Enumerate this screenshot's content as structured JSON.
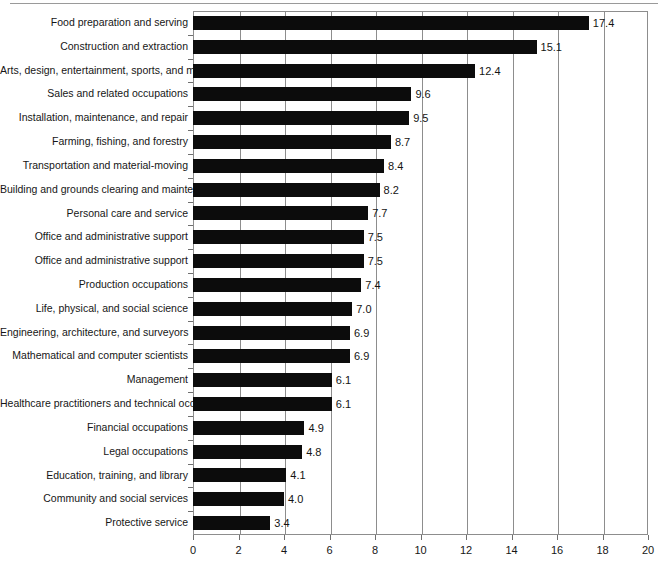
{
  "chart_data": {
    "type": "bar",
    "orientation": "horizontal",
    "title": "",
    "subtitle": "",
    "xlabel": "",
    "ylabel": "",
    "xlim": [
      0,
      20
    ],
    "xticks": [
      0,
      2,
      4,
      6,
      8,
      10,
      12,
      14,
      16,
      18,
      20
    ],
    "xtick_labels": [
      "0",
      "2",
      "4",
      "6",
      "8",
      "10",
      "12",
      "14",
      "16",
      "18",
      "20"
    ],
    "grid": "vertical gridlines at every x tick",
    "legend": "none",
    "bar_color": "#0c0c0c",
    "categories": [
      "Food preparation and serving",
      "Construction and extraction",
      "Arts, design, entertainment, sports, and media",
      "Sales and related occupations",
      "Installation, maintenance, and repair",
      "Farming, fishing, and forestry",
      "Transportation and material-moving",
      "Building and grounds clearing and maintenance",
      "Personal care and service",
      "Office and administrative support",
      "Office and administrative support",
      "Production occupations",
      "Life, physical, and social science",
      "Engineering, architecture, and surveyors",
      "Mathematical and computer scientists",
      "Management",
      "Healthcare practitioners and technical occupations",
      "Financial occupations",
      "Legal occupations",
      "Education, training, and library",
      "Community and social services",
      "Protective service"
    ],
    "values": [
      17.4,
      15.1,
      12.4,
      9.6,
      9.5,
      8.7,
      8.4,
      8.2,
      7.7,
      7.5,
      7.5,
      7.4,
      7.0,
      6.9,
      6.9,
      6.1,
      6.1,
      4.9,
      4.8,
      4.1,
      4.0,
      3.4
    ],
    "value_labels": [
      "17.4",
      "15.1",
      "12.4",
      "9.6",
      "9.5",
      "8.7",
      "8.4",
      "8.2",
      "7.7",
      "7.5",
      "7.5",
      "7.4",
      "7.0",
      "6.9",
      "6.9",
      "6.1",
      "6.1",
      "4.9",
      "4.8",
      "4.1",
      "4.0",
      "3.4"
    ]
  }
}
